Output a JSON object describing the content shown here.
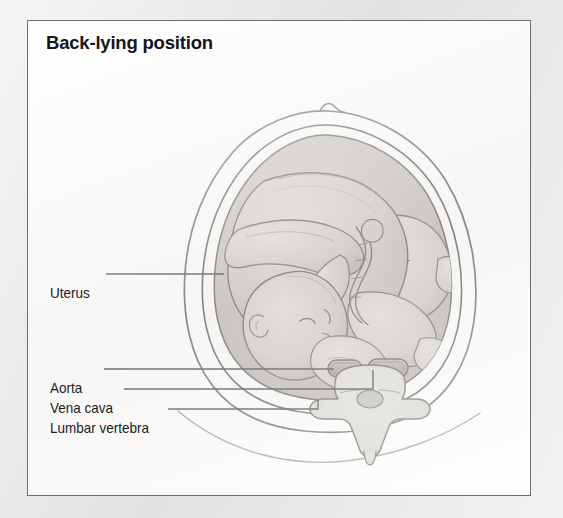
{
  "figure": {
    "title": "Back-lying position",
    "panel_background": "#fdfdfc",
    "page_background": "#eceae8",
    "border_color": "#6e6e70"
  },
  "labels": [
    {
      "id": "uterus",
      "text": "Uterus",
      "points_to": "uterine-wall"
    },
    {
      "id": "aorta",
      "text": "Aorta",
      "points_to": "aorta-vessel"
    },
    {
      "id": "vena_cava",
      "text": "Vena cava",
      "points_to": "vena-cava-vessel"
    },
    {
      "id": "lumbar_vertebra",
      "text": "Lumbar vertebra",
      "points_to": "vertebra-body"
    }
  ],
  "anatomy": {
    "maternal_abdomen": "outer body contour, supine",
    "umbilicus": "navel notch at abdomen apex",
    "uterus_wall": "uterine wall, double outline",
    "amniotic_cavity": "#bcb8b4",
    "fetus": "fetus in cephalic presentation, curled",
    "umbilical_cord": "umbilical cord",
    "aorta": "aorta, left of midline",
    "vena_cava": "inferior vena cava, right of midline",
    "vertebra": "lumbar vertebra with transverse and spinous processes",
    "support_surface": "back resting surface contour"
  },
  "colors": {
    "ink": "#3a3a3e",
    "amniotic_fluid": "#bcb8b4",
    "fetus_skin": "#cfcbc7",
    "vessel_fill": "#a9a5a2",
    "vertebra_fill": "#d6d3cf",
    "label_text": "#1c1c1f"
  }
}
